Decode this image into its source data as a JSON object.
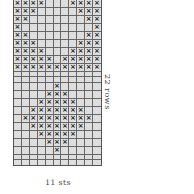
{
  "chart": {
    "columns": 11,
    "rows_count": 22,
    "stitch_symbol": "×",
    "rows_label": "22 rows",
    "sts_label": "11 sts",
    "pattern": [
      "XXXX...XXXX",
      "XXX.....XXX",
      "XX.......XX",
      "X.........X",
      "XX.......XX",
      "XXX.....XXX",
      "XXXX...XXXX",
      "XXXXX.XXXXX",
      "XXXXXXXXXXX",
      "...........",
      "...........",
      ".....X.....",
      "....XXX....",
      "...XXXXX...",
      "..XXXXXXX..",
      ".XXXXXXXXX.",
      "..XXXXXXX..",
      "...XXXXX...",
      "....XXX....",
      ".....X.....",
      "...........",
      "..........."
    ],
    "colors": {
      "cell": "#dedede",
      "grid_line": "#666666",
      "mark": "#222222"
    }
  }
}
